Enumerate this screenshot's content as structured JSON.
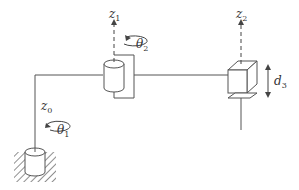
{
  "diagram": {
    "type": "robot-manipulator-kinematic-sketch",
    "joints": [
      {
        "id": "joint1",
        "kind": "revolute",
        "axis_label": "z",
        "axis_sub": "0",
        "var_label": "θ",
        "var_sub": "1"
      },
      {
        "id": "joint2",
        "kind": "revolute",
        "axis_label": "z",
        "axis_sub": "1",
        "var_label": "θ",
        "var_sub": "2"
      },
      {
        "id": "joint3",
        "kind": "prismatic",
        "axis_label": "z",
        "axis_sub": "2",
        "var_label": "d",
        "var_sub": "3"
      }
    ],
    "colors": {
      "line": "#555555",
      "text": "#333333",
      "background": "#ffffff"
    }
  }
}
